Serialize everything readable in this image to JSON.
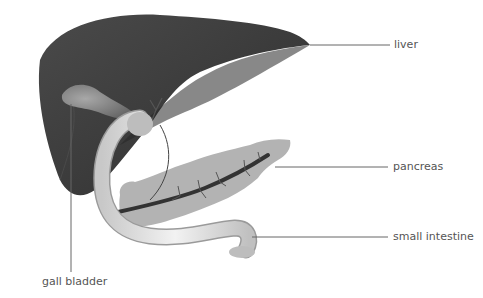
{
  "diagram": {
    "type": "anatomical illustration",
    "labels": {
      "liver": "liver",
      "pancreas": "pancreas",
      "small_intestine": "small intestine",
      "gall_bladder": "gall bladder"
    },
    "colors": {
      "liver": "#3d3d3d",
      "liver_dark": "#2a2a2a",
      "gall_bladder": "#8a8a8a",
      "pancreas": "#b5b5b5",
      "duct": "#3a3a3a",
      "intestine": "#e4e4e4",
      "leader_line": "#666666",
      "text": "#555555"
    }
  }
}
